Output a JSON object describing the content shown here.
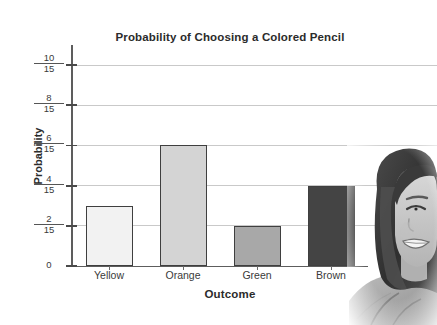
{
  "chart_data": {
    "type": "bar",
    "title": "Probability of Choosing a Colored Pencil",
    "xlabel": "Outcome",
    "ylabel": "Probability",
    "categories": [
      "Yellow",
      "Orange",
      "Green",
      "Brown"
    ],
    "values": [
      0.2,
      0.4,
      0.13333,
      0.26667
    ],
    "value_labels": [
      "3/15",
      "6/15",
      "2/15",
      "4/15"
    ],
    "bar_colors": [
      "#f2f2f2",
      "#d4d4d4",
      "#a8a8a8",
      "#444444"
    ],
    "bar_edge_color": "#3f3f3f",
    "ylim": [
      0,
      0.73333
    ],
    "ytick_values": [
      0,
      0.13333,
      0.26667,
      0.4,
      0.53333,
      0.66667
    ],
    "ytick_labels": [
      {
        "numerator": "0",
        "denominator": "",
        "whole": true
      },
      {
        "numerator": "2",
        "denominator": "15",
        "whole": false
      },
      {
        "numerator": "4",
        "denominator": "15",
        "whole": false
      },
      {
        "numerator": "6",
        "denominator": "15",
        "whole": false
      },
      {
        "numerator": "8",
        "denominator": "15",
        "whole": false
      },
      {
        "numerator": "10",
        "denominator": "15",
        "whole": false
      }
    ],
    "grid": true,
    "grid_color": "#c9c9c9",
    "legend": "none",
    "axis_color": "#5d5d5d",
    "text_color": "#2b2b2b"
  },
  "photo": {
    "alt": "smiling-student-portrait",
    "description": "Grayscale photo of a smiling girl with long dark hair, cropped at the right edge"
  }
}
